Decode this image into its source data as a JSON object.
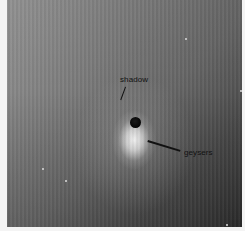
{
  "image": {
    "description": "Grayscale space image of a moon with bright plume jets",
    "background_gradient": [
      "#9a9a9a",
      "#2e2e2e"
    ],
    "plume_color": "#ffffff",
    "moon_color": "#0a0a0a",
    "border_color": "#f4f4f4"
  },
  "annotations": [
    {
      "label": "shadow",
      "text_x": 119,
      "text_y": 74,
      "line": [
        [
          126,
          86
        ],
        [
          121,
          100
        ]
      ]
    },
    {
      "label": "geysers",
      "text_x": 184,
      "text_y": 147,
      "line": [
        [
          148,
          140
        ],
        [
          180,
          150
        ]
      ]
    }
  ],
  "stars": [
    {
      "x": 185,
      "y": 39
    },
    {
      "x": 241,
      "y": 91
    },
    {
      "x": 42,
      "y": 169
    },
    {
      "x": 65,
      "y": 181
    },
    {
      "x": 226,
      "y": 225
    }
  ]
}
